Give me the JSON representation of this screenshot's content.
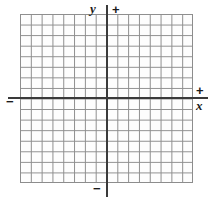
{
  "figure": {
    "type": "coordinate-grid",
    "grid": {
      "columns": 16,
      "rows": 16,
      "columns_left_of_y_axis": 8,
      "columns_right_of_y_axis": 8,
      "rows_above_x_axis": 8,
      "rows_below_x_axis": 8,
      "grid_visible": true,
      "tick_labels": [],
      "grid_color": "#8d8d8d",
      "background_color": "#fdfdfd"
    },
    "axes": {
      "color": "#3a3a3a",
      "x": {
        "name": "x",
        "positive_sign": "+",
        "negative_sign": "−"
      },
      "y": {
        "name": "y",
        "positive_sign": "+",
        "negative_sign": "−"
      }
    }
  }
}
